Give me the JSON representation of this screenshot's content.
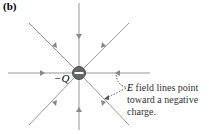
{
  "panel_label": "(b)",
  "charge_label": "−Q",
  "charge_sign": "−",
  "annotation": {
    "vector": "E",
    "line1": " field lines point",
    "line2": "toward a negative",
    "line3": "charge."
  },
  "colors": {
    "field_line": "#888888",
    "annotation_arrow": "#555555",
    "charge": "#555555"
  }
}
